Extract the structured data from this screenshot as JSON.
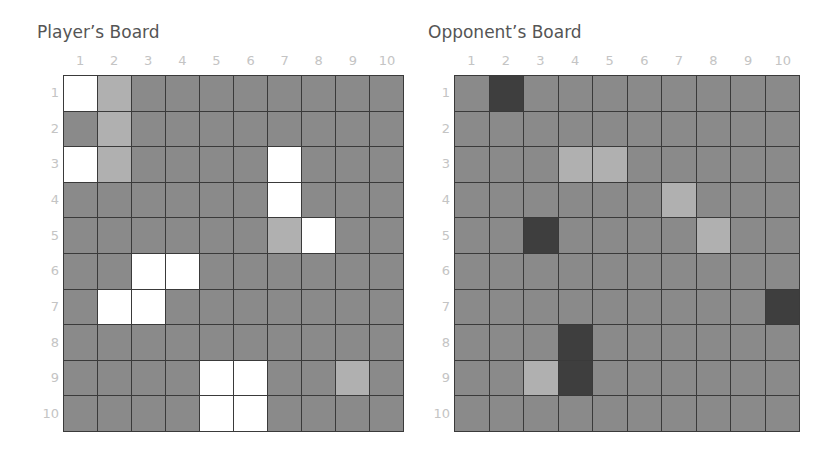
{
  "colors": {
    "water": "#8a8a8a",
    "ship": "#ffffff",
    "hit": "#b0b0b0",
    "sunk": "#3e3e3e",
    "grid_line": "#3a3a3a",
    "label": "#c4c4c4",
    "title": "#555555"
  },
  "columns": [
    "1",
    "2",
    "3",
    "4",
    "5",
    "6",
    "7",
    "8",
    "9",
    "10"
  ],
  "rows": [
    "1",
    "2",
    "3",
    "4",
    "5",
    "6",
    "7",
    "8",
    "9",
    "10"
  ],
  "player_board": {
    "title": "Player’s Board",
    "cells": [
      [
        "ship",
        "hit",
        "empty",
        "empty",
        "empty",
        "empty",
        "empty",
        "empty",
        "empty",
        "empty"
      ],
      [
        "empty",
        "hit",
        "empty",
        "empty",
        "empty",
        "empty",
        "empty",
        "empty",
        "empty",
        "empty"
      ],
      [
        "ship",
        "hit",
        "empty",
        "empty",
        "empty",
        "empty",
        "ship",
        "empty",
        "empty",
        "empty"
      ],
      [
        "empty",
        "empty",
        "empty",
        "empty",
        "empty",
        "empty",
        "ship",
        "empty",
        "empty",
        "empty"
      ],
      [
        "empty",
        "empty",
        "empty",
        "empty",
        "empty",
        "empty",
        "hit",
        "ship",
        "empty",
        "empty"
      ],
      [
        "empty",
        "empty",
        "ship",
        "ship",
        "empty",
        "empty",
        "empty",
        "empty",
        "empty",
        "empty"
      ],
      [
        "empty",
        "ship",
        "ship",
        "empty",
        "empty",
        "empty",
        "empty",
        "empty",
        "empty",
        "empty"
      ],
      [
        "empty",
        "empty",
        "empty",
        "empty",
        "empty",
        "empty",
        "empty",
        "empty",
        "empty",
        "empty"
      ],
      [
        "empty",
        "empty",
        "empty",
        "empty",
        "ship",
        "ship",
        "empty",
        "empty",
        "hit",
        "empty"
      ],
      [
        "empty",
        "empty",
        "empty",
        "empty",
        "ship",
        "ship",
        "empty",
        "empty",
        "empty",
        "empty"
      ]
    ]
  },
  "opponent_board": {
    "title": "Opponent’s Board",
    "cells": [
      [
        "empty",
        "sunk",
        "empty",
        "empty",
        "empty",
        "empty",
        "empty",
        "empty",
        "empty",
        "empty"
      ],
      [
        "empty",
        "empty",
        "empty",
        "empty",
        "empty",
        "empty",
        "empty",
        "empty",
        "empty",
        "empty"
      ],
      [
        "empty",
        "empty",
        "empty",
        "hit",
        "hit",
        "empty",
        "empty",
        "empty",
        "empty",
        "empty"
      ],
      [
        "empty",
        "empty",
        "empty",
        "empty",
        "empty",
        "empty",
        "hit",
        "empty",
        "empty",
        "empty"
      ],
      [
        "empty",
        "empty",
        "sunk",
        "empty",
        "empty",
        "empty",
        "empty",
        "hit",
        "empty",
        "empty"
      ],
      [
        "empty",
        "empty",
        "empty",
        "empty",
        "empty",
        "empty",
        "empty",
        "empty",
        "empty",
        "empty"
      ],
      [
        "empty",
        "empty",
        "empty",
        "empty",
        "empty",
        "empty",
        "empty",
        "empty",
        "empty",
        "sunk"
      ],
      [
        "empty",
        "empty",
        "empty",
        "sunk",
        "empty",
        "empty",
        "empty",
        "empty",
        "empty",
        "empty"
      ],
      [
        "empty",
        "empty",
        "hit",
        "sunk",
        "empty",
        "empty",
        "empty",
        "empty",
        "empty",
        "empty"
      ],
      [
        "empty",
        "empty",
        "empty",
        "empty",
        "empty",
        "empty",
        "empty",
        "empty",
        "empty",
        "empty"
      ]
    ]
  }
}
